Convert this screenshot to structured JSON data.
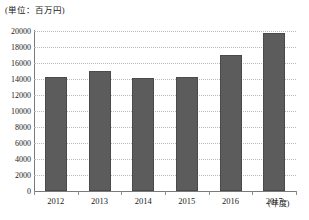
{
  "chart_data": {
    "type": "bar",
    "title": "",
    "subtitle": "",
    "unit_label": "(単位：百万円)",
    "xlabel": "(年度)",
    "ylabel": "",
    "categories": [
      "2012",
      "2013",
      "2014",
      "2015",
      "2016",
      "2017"
    ],
    "values": [
      14200,
      15000,
      14100,
      14300,
      17000,
      19800
    ],
    "series": [
      {
        "name": "金額",
        "values": [
          14200,
          15000,
          14100,
          14300,
          17000,
          19800
        ]
      }
    ],
    "ylim": [
      0,
      20000
    ],
    "ytick_step": 2000,
    "yticks": [
      20000,
      18000,
      16000,
      14000,
      12000,
      10000,
      8000,
      6000,
      4000,
      2000,
      0
    ],
    "ytick_labels": [
      "20000",
      "18000",
      "16000",
      "14000",
      "12000",
      "10000",
      "8000",
      "6000",
      "4000",
      "2000",
      "0"
    ],
    "grid": true,
    "legend": false,
    "legend_position": "none",
    "bar_color": "#5c5c5c",
    "grid_color": "#b9b9b9",
    "axis_color": "#7a7a7a",
    "text_color": "#1a1a1a"
  }
}
